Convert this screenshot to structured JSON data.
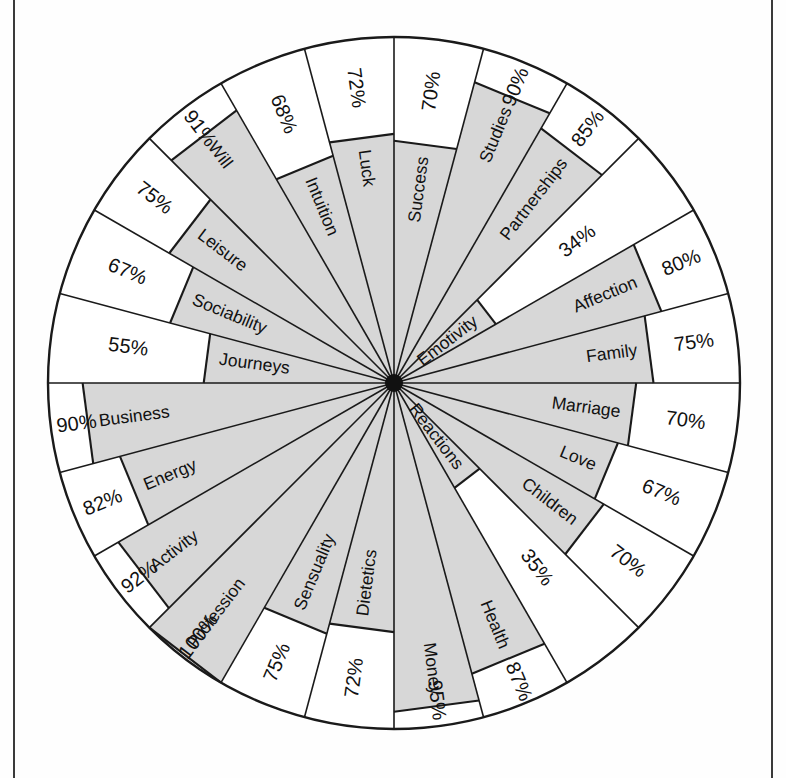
{
  "figure": {
    "title": "",
    "center_x": 394,
    "center_y": 383,
    "radius": 346,
    "hub_radius": 9,
    "fill_color": "#d7d7d7",
    "line_color": "#1a1a1a",
    "background_color": "#ffffff",
    "sector_count": 24,
    "start_angle_deg": -90,
    "label_suffix": "%"
  },
  "chart_data": {
    "type": "radar",
    "title": "",
    "xlabel": "",
    "ylabel": "",
    "ylim": [
      0,
      100
    ],
    "grid": false,
    "legend": "none",
    "units": "percent",
    "categories": [
      "Success",
      "Studies",
      "Partnerships",
      "Emotivity",
      "Affection",
      "Family",
      "Marriage",
      "Love",
      "Children",
      "Reactions",
      "Health",
      "Money",
      "Dietetics",
      "Sensuality",
      "Profession",
      "Activity",
      "Energy",
      "Business",
      "Journeys",
      "Sociability",
      "Leisure",
      "Will",
      "Intuition",
      "Luck"
    ],
    "values": [
      70,
      90,
      85,
      34,
      80,
      75,
      70,
      67,
      70,
      35,
      87,
      95,
      72,
      75,
      100,
      92,
      82,
      90,
      55,
      67,
      75,
      91,
      68,
      72
    ],
    "value_labels": [
      "70%",
      "90%",
      "85%",
      "34%",
      "80%",
      "75%",
      "70%",
      "67%",
      "70%",
      "35%",
      "87%",
      "95%",
      "72%",
      "75%",
      "100%",
      "92%",
      "82%",
      "90%",
      "55%",
      "67%",
      "75%",
      "91%",
      "68%",
      "72%"
    ],
    "series": [
      {
        "name": "",
        "values": [
          70,
          90,
          85,
          34,
          80,
          75,
          70,
          67,
          70,
          35,
          87,
          95,
          72,
          75,
          100,
          92,
          82,
          90,
          55,
          67,
          75,
          91,
          68,
          72
        ]
      }
    ],
    "sectors": [
      {
        "label": "Success",
        "value": 70,
        "value_label": "70%"
      },
      {
        "label": "Studies",
        "value": 90,
        "value_label": "90%"
      },
      {
        "label": "Partnerships",
        "value": 85,
        "value_label": "85%"
      },
      {
        "label": "Emotivity",
        "value": 34,
        "value_label": "34%"
      },
      {
        "label": "Affection",
        "value": 80,
        "value_label": "80%"
      },
      {
        "label": "Family",
        "value": 75,
        "value_label": "75%"
      },
      {
        "label": "Marriage",
        "value": 70,
        "value_label": "70%"
      },
      {
        "label": "Love",
        "value": 67,
        "value_label": "67%"
      },
      {
        "label": "Children",
        "value": 70,
        "value_label": "70%"
      },
      {
        "label": "Reactions",
        "value": 35,
        "value_label": "35%"
      },
      {
        "label": "Health",
        "value": 87,
        "value_label": "87%"
      },
      {
        "label": "Money",
        "value": 95,
        "value_label": "95%"
      },
      {
        "label": "Dietetics",
        "value": 72,
        "value_label": "72%"
      },
      {
        "label": "Sensuality",
        "value": 75,
        "value_label": "75%"
      },
      {
        "label": "Profession",
        "value": 100,
        "value_label": "100%"
      },
      {
        "label": "Activity",
        "value": 92,
        "value_label": "92%"
      },
      {
        "label": "Energy",
        "value": 82,
        "value_label": "82%"
      },
      {
        "label": "Business",
        "value": 90,
        "value_label": "90%"
      },
      {
        "label": "Journeys",
        "value": 55,
        "value_label": "55%"
      },
      {
        "label": "Sociability",
        "value": 67,
        "value_label": "67%"
      },
      {
        "label": "Leisure",
        "value": 75,
        "value_label": "75%"
      },
      {
        "label": "Will",
        "value": 91,
        "value_label": "91%"
      },
      {
        "label": "Intuition",
        "value": 68,
        "value_label": "68%"
      },
      {
        "label": "Luck",
        "value": 72,
        "value_label": "72%"
      }
    ]
  }
}
